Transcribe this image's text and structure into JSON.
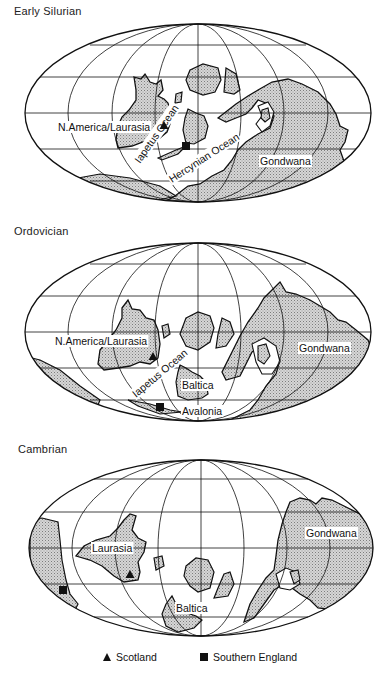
{
  "figure": {
    "panels": [
      {
        "id": "early-silurian",
        "title": "Early Silurian",
        "title_pos": [
          14,
          12
        ],
        "ellipse": {
          "cx": 198,
          "cy": 113,
          "rx": 173,
          "ry": 89
        },
        "labels": [
          {
            "text": "N.America/Laurasia",
            "x": 58,
            "y": 131,
            "rot": 0
          },
          {
            "text": "Iapetus Ocean",
            "x": 140,
            "y": 164,
            "rot": -55
          },
          {
            "text": "Hercynian Ocean",
            "x": 172,
            "y": 183,
            "rot": -33
          },
          {
            "text": "Gondwana",
            "x": 260,
            "y": 165,
            "rot": 0
          }
        ],
        "markers": [
          {
            "type": "triangle",
            "label": "Scotland",
            "x": 164,
            "y": 126
          },
          {
            "type": "square",
            "label": "Southern England",
            "x": 186,
            "y": 146
          }
        ]
      },
      {
        "id": "ordovician",
        "title": "Ordovician",
        "title_pos": [
          14,
          232
        ],
        "ellipse": {
          "cx": 198,
          "cy": 332,
          "rx": 173,
          "ry": 89
        },
        "labels": [
          {
            "text": "N.America/Laurasia",
            "x": 55,
            "y": 345,
            "rot": 0
          },
          {
            "text": "Iapetus Ocean",
            "x": 136,
            "y": 398,
            "rot": -40
          },
          {
            "text": "Baltica",
            "x": 182,
            "y": 389,
            "rot": 0
          },
          {
            "text": "Avalonia",
            "x": 182,
            "y": 415,
            "rot": 0
          },
          {
            "text": "Gondwana",
            "x": 299,
            "y": 352,
            "rot": 0
          }
        ],
        "markers": [
          {
            "type": "triangle",
            "label": "Scotland",
            "x": 153,
            "y": 357
          },
          {
            "type": "square",
            "label": "Southern England",
            "x": 160,
            "y": 407
          }
        ]
      },
      {
        "id": "cambrian",
        "title": "Cambrian",
        "title_pos": [
          18,
          449
        ],
        "ellipse": {
          "cx": 201,
          "cy": 548,
          "rx": 172,
          "ry": 88
        },
        "labels": [
          {
            "text": "Laurasia",
            "x": 92,
            "y": 552,
            "rot": 0
          },
          {
            "text": "Baltica",
            "x": 176,
            "y": 612,
            "rot": 0
          },
          {
            "text": "Gondwana",
            "x": 306,
            "y": 537,
            "rot": 0
          }
        ],
        "markers": [
          {
            "type": "triangle",
            "label": "Scotland",
            "x": 130,
            "y": 575
          },
          {
            "type": "square",
            "label": "Southern England",
            "x": 63,
            "y": 590
          }
        ]
      }
    ],
    "legend": [
      {
        "symbol": "triangle",
        "label": "Scotland"
      },
      {
        "symbol": "square",
        "label": "Southern England"
      }
    ],
    "colors": {
      "outline": "#111111",
      "land_fill": "#c8c8c8",
      "land_dots": "#8a8a8a",
      "background": "#ffffff"
    }
  }
}
